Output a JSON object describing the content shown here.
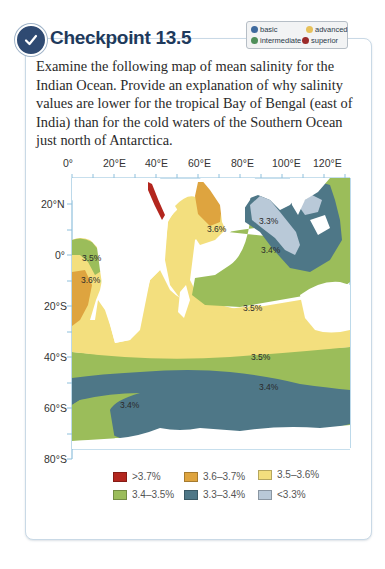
{
  "header": {
    "icon": "checkmark-circle-icon",
    "title": "Checkpoint 13.5"
  },
  "level_key": [
    {
      "label": "basic",
      "color": "#3f6a9e"
    },
    {
      "label": "advanced",
      "color": "#e7c15a"
    },
    {
      "label": "intermediate",
      "color": "#4f8f5a"
    },
    {
      "label": "superior",
      "color": "#9b2a2a"
    }
  ],
  "question": "Examine the following map of mean salinity for the Indian Ocean. Provide an explanation of why salinity values are lower for the tropical Bay of Bengal (east of India) than for the cold waters of the Southern Ocean just north of Antarctica.",
  "map": {
    "x_ticks": [
      "0°",
      "20°E",
      "40°E",
      "60°E",
      "80°E",
      "100°E",
      "120°E"
    ],
    "y_ticks": [
      "20°N",
      "0°",
      "20°S",
      "40°S",
      "60°S",
      "80°S"
    ],
    "region_labels": [
      {
        "text": "3.5%",
        "region": "west Africa coast"
      },
      {
        "text": "3.6%",
        "region": "southwest Africa"
      },
      {
        "text": "3.6%",
        "region": "Arabian Sea"
      },
      {
        "text": "3.3%",
        "region": "Bay of Bengal"
      },
      {
        "text": "3.4%",
        "region": "east Indian Ocean"
      },
      {
        "text": "3.5%",
        "region": "central Indian Ocean"
      },
      {
        "text": "3.5%",
        "region": "40°S band"
      },
      {
        "text": "3.4%",
        "region": "Southern Ocean east"
      },
      {
        "text": "3.4%",
        "region": "Southern Ocean west"
      }
    ]
  },
  "legend": [
    {
      "label": ">3.7%",
      "color": "#b3261e"
    },
    {
      "label": "3.6–3.7%",
      "color": "#dea43f"
    },
    {
      "label": "3.5–3.6%",
      "color": "#f3df7e"
    },
    {
      "label": "3.4–3.5%",
      "color": "#9bbd5a"
    },
    {
      "label": "3.3–3.4%",
      "color": "#4e7787"
    },
    {
      "label": "<3.3%",
      "color": "#b9c9d8"
    }
  ]
}
